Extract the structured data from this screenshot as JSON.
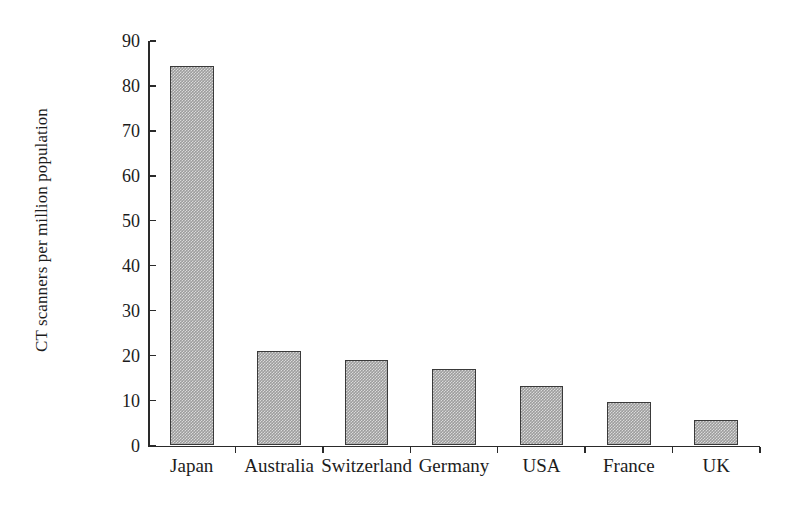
{
  "chart_data": {
    "type": "bar",
    "title": "",
    "subtitle": "",
    "xlabel": "",
    "ylabel": "CT scanners per million population",
    "categories": [
      "Japan",
      "Australia",
      "Switzerland",
      "Germany",
      "USA",
      "France",
      "UK"
    ],
    "values": [
      84.5,
      21.0,
      19.0,
      17.0,
      13.2,
      9.7,
      5.7
    ],
    "ylim": [
      0,
      90
    ],
    "y_ticks": [
      0,
      10,
      20,
      30,
      40,
      50,
      60,
      70,
      80,
      90
    ],
    "y_tick_labels": [
      "0",
      "10",
      "20",
      "30",
      "40",
      "50",
      "60",
      "70",
      "80",
      "90"
    ],
    "grid": false,
    "legend": null,
    "legend_position": "none",
    "bar_fill_color": "#9d9d9d",
    "bar_border_color": "#3a3a3a",
    "axis_color": "#2a2a2a",
    "background_color": "#ffffff",
    "tick_direction": "in",
    "annotations": []
  }
}
